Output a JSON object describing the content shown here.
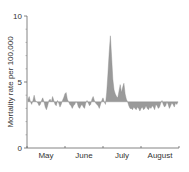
{
  "chart_data": {
    "type": "area",
    "title": "",
    "xlabel": "",
    "ylabel": "Mortality rate per 100,000",
    "ylim": [
      0,
      10
    ],
    "yticks": [
      0,
      5,
      10
    ],
    "y_minor_ticks": [
      1,
      2,
      3,
      4,
      6,
      7,
      8,
      9
    ],
    "x_month_labels": [
      "May",
      "June",
      "July",
      "August"
    ],
    "baseline": 3.5,
    "fill_color": "#9a9a9a",
    "grid": false,
    "legend": null,
    "x_start": "May 1",
    "x_end": "Aug 31",
    "values": [
      3.7,
      3.9,
      3.5,
      3.3,
      3.6,
      4.0,
      3.6,
      3.5,
      3.4,
      3.2,
      3.3,
      3.6,
      3.8,
      3.5,
      3.1,
      2.9,
      3.2,
      3.6,
      3.7,
      3.5,
      3.9,
      3.6,
      3.3,
      3.2,
      3.6,
      3.4,
      3.1,
      3.3,
      3.6,
      3.8,
      4.1,
      4.2,
      3.7,
      3.5,
      3.3,
      3.2,
      3.0,
      3.2,
      3.3,
      3.5,
      3.4,
      3.1,
      3.0,
      3.2,
      3.3,
      3.1,
      3.0,
      3.4,
      3.6,
      3.4,
      3.2,
      3.3,
      3.7,
      3.9,
      3.6,
      3.4,
      3.3,
      3.2,
      3.0,
      3.3,
      3.6,
      3.8,
      3.5,
      3.3,
      4.2,
      5.6,
      7.2,
      8.5,
      6.9,
      5.2,
      4.4,
      4.1,
      3.9,
      3.8,
      4.3,
      4.8,
      4.2,
      4.6,
      4.9,
      4.1,
      3.7,
      3.5,
      3.2,
      3.0,
      3.0,
      2.9,
      3.1,
      3.0,
      2.9,
      3.1,
      3.0,
      2.8,
      3.0,
      3.1,
      2.9,
      3.0,
      3.2,
      3.0,
      2.9,
      3.1,
      3.0,
      3.2,
      3.1,
      2.9,
      3.3,
      3.2,
      3.0,
      3.1,
      3.4,
      3.6,
      3.3,
      3.1,
      3.2,
      3.5,
      3.3,
      3.0,
      3.2,
      3.4,
      3.3,
      3.1,
      3.4,
      3.3,
      3.5
    ]
  }
}
